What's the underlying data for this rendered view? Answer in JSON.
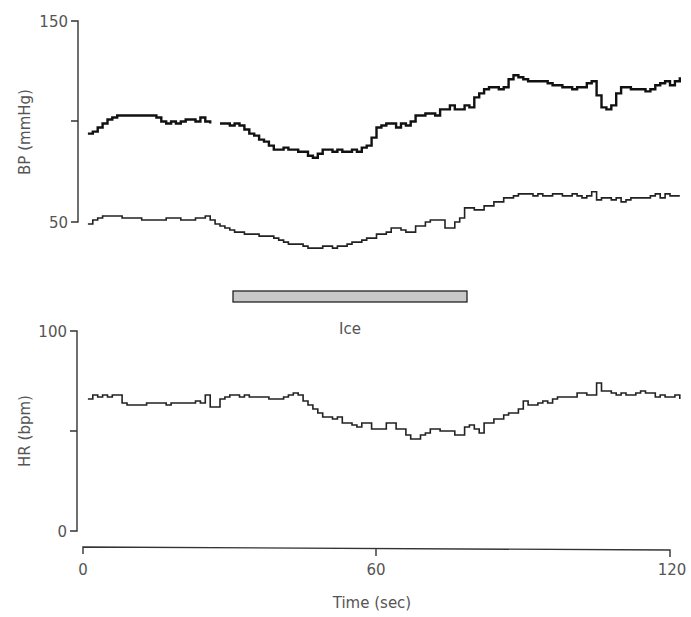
{
  "chart_data": [
    {
      "type": "line",
      "panel": "top",
      "title": "",
      "xlabel": "",
      "ylabel": "BP (mmHg)",
      "ylim": [
        50,
        150
      ],
      "yticks": [
        50,
        100,
        150
      ],
      "ytick_labels": [
        "50",
        "",
        "150"
      ],
      "xlim": [
        0,
        120
      ],
      "step": true,
      "series": [
        {
          "name": "Systolic BP",
          "x": [
            1,
            2,
            3,
            4,
            5,
            6,
            7,
            8,
            10,
            12,
            14,
            15,
            16,
            17,
            18,
            19,
            20,
            21,
            22,
            23,
            24,
            25,
            26,
            27,
            28,
            29,
            30,
            31,
            32,
            33,
            34,
            35,
            36,
            37,
            38,
            39,
            40,
            41,
            42,
            43,
            44,
            45,
            46,
            47,
            48,
            49,
            50,
            51,
            52,
            53,
            54,
            55,
            56,
            57,
            58,
            59,
            60,
            61,
            62,
            63,
            64,
            65,
            66,
            67,
            68,
            69,
            70,
            71,
            72,
            73,
            74,
            75,
            76,
            77,
            78,
            79,
            80,
            81,
            82,
            83,
            84,
            85,
            86,
            87,
            88,
            89,
            90,
            91,
            92,
            93,
            94,
            95,
            96,
            97,
            98,
            99,
            100,
            101,
            102,
            103,
            104,
            105,
            106,
            107,
            108,
            109,
            110,
            111,
            112,
            113,
            114,
            115,
            116,
            117,
            118,
            119,
            120,
            121,
            122
          ],
          "values": [
            94,
            95,
            97,
            99,
            101,
            102,
            103,
            103,
            103,
            103,
            103,
            102,
            100,
            99,
            100,
            99,
            100,
            101,
            101,
            100,
            102,
            100,
            99,
            null,
            99,
            99,
            98,
            99,
            98,
            96,
            94,
            93,
            91,
            90,
            88,
            86,
            86,
            87,
            86,
            86,
            85,
            85,
            83,
            82,
            84,
            86,
            86,
            85,
            86,
            85,
            85,
            86,
            85,
            87,
            88,
            92,
            97,
            98,
            99,
            99,
            97,
            99,
            98,
            100,
            103,
            103,
            104,
            104,
            103,
            106,
            106,
            108,
            106,
            106,
            108,
            107,
            112,
            114,
            116,
            117,
            117,
            116,
            117,
            121,
            123,
            122,
            121,
            120,
            120,
            120,
            120,
            119,
            118,
            118,
            117,
            117,
            116,
            117,
            117,
            119,
            120,
            113,
            107,
            106,
            108,
            114,
            117,
            117,
            116,
            116,
            116,
            115,
            116,
            118,
            119,
            120,
            118,
            120,
            122,
            122,
            120,
            121,
            122,
            120,
            122,
            121,
            122,
            122,
            121,
            121
          ]
        },
        {
          "name": "Diastolic BP",
          "x": [
            1,
            2,
            3,
            4,
            5,
            6,
            7,
            8,
            9,
            10,
            11,
            12,
            13,
            14,
            15,
            16,
            17,
            18,
            19,
            20,
            21,
            22,
            23,
            24,
            25,
            26,
            27,
            28,
            29,
            30,
            31,
            32,
            33,
            34,
            35,
            36,
            37,
            38,
            39,
            40,
            41,
            42,
            43,
            44,
            45,
            46,
            47,
            48,
            49,
            50,
            51,
            52,
            53,
            54,
            55,
            56,
            57,
            58,
            59,
            60,
            61,
            62,
            63,
            64,
            65,
            66,
            67,
            68,
            69,
            70,
            71,
            72,
            73,
            74,
            75,
            76,
            77,
            78,
            79,
            80,
            81,
            82,
            83,
            84,
            85,
            86,
            87,
            88,
            89,
            90,
            91,
            92,
            93,
            94,
            95,
            96,
            97,
            98,
            99,
            100,
            101,
            102,
            103,
            104,
            105,
            106,
            107,
            108,
            109,
            110,
            111,
            112,
            113,
            114,
            115,
            116,
            117,
            118,
            119,
            120,
            121,
            122
          ],
          "values": [
            49,
            51,
            52,
            53,
            53,
            53,
            53,
            52,
            52,
            52,
            52,
            51,
            51,
            51,
            51,
            51,
            52,
            52,
            52,
            51,
            51,
            51,
            52,
            52,
            53,
            51,
            49,
            48,
            47,
            46,
            45,
            45,
            44,
            44,
            44,
            43,
            43,
            43,
            42,
            41,
            40,
            39,
            39,
            39,
            38,
            37,
            37,
            37,
            38,
            38,
            37,
            38,
            38,
            39,
            40,
            40,
            41,
            42,
            42,
            44,
            44,
            45,
            47,
            47,
            46,
            45,
            45,
            48,
            48,
            50,
            51,
            51,
            51,
            47,
            47,
            50,
            52,
            57,
            57,
            56,
            56,
            58,
            58,
            60,
            60,
            62,
            62,
            63,
            64,
            64,
            64,
            63,
            64,
            63,
            63,
            64,
            64,
            63,
            63,
            64,
            63,
            62,
            63,
            65,
            61,
            62,
            62,
            61,
            62,
            60,
            61,
            62,
            62,
            62,
            62,
            63,
            64,
            62,
            64,
            63,
            63,
            63
          ],
          "note": "steps approximate"
        }
      ],
      "annotations": [
        {
          "type": "bar",
          "label": "Ice",
          "x_start": 31,
          "x_end": 78
        }
      ]
    },
    {
      "type": "line",
      "panel": "bottom",
      "title": "",
      "xlabel": "Time (sec)",
      "ylabel": "HR (bpm)",
      "ylim": [
        0,
        100
      ],
      "yticks": [
        0,
        50,
        100
      ],
      "ytick_labels": [
        "0",
        "",
        "100"
      ],
      "xlim": [
        0,
        120
      ],
      "xticks": [
        0,
        60,
        120
      ],
      "xtick_labels": [
        "0",
        "60",
        "120"
      ],
      "step": true,
      "series": [
        {
          "name": "HR",
          "x": [
            1,
            2,
            3,
            4,
            5,
            6,
            7,
            8,
            9,
            10,
            11,
            12,
            13,
            14,
            15,
            16,
            17,
            18,
            19,
            20,
            21,
            22,
            23,
            24,
            25,
            26,
            27,
            28,
            29,
            30,
            31,
            32,
            33,
            34,
            35,
            36,
            37,
            38,
            39,
            40,
            41,
            42,
            43,
            44,
            45,
            46,
            47,
            48,
            49,
            50,
            51,
            52,
            53,
            54,
            55,
            56,
            57,
            58,
            59,
            60,
            61,
            62,
            63,
            64,
            65,
            66,
            67,
            68,
            69,
            70,
            71,
            72,
            73,
            74,
            75,
            76,
            77,
            78,
            79,
            80,
            81,
            82,
            83,
            84,
            85,
            86,
            87,
            88,
            89,
            90,
            91,
            92,
            93,
            94,
            95,
            96,
            97,
            98,
            99,
            100,
            101,
            102,
            103,
            104,
            105,
            106,
            107,
            108,
            109,
            110,
            111,
            112,
            113,
            114,
            115,
            116,
            117,
            118,
            119,
            120,
            121,
            122
          ],
          "values": [
            66,
            68,
            67,
            68,
            67,
            68,
            68,
            64,
            63,
            63,
            63,
            63,
            64,
            64,
            64,
            64,
            63,
            64,
            64,
            64,
            64,
            64,
            65,
            64,
            68,
            62,
            62,
            66,
            67,
            68,
            68,
            67,
            68,
            67,
            67,
            67,
            67,
            66,
            66,
            66,
            67,
            68,
            69,
            68,
            65,
            63,
            61,
            59,
            57,
            57,
            56,
            57,
            54,
            54,
            53,
            52,
            54,
            54,
            51,
            51,
            51,
            54,
            54,
            51,
            51,
            48,
            46,
            46,
            48,
            49,
            51,
            51,
            50,
            50,
            50,
            48,
            48,
            52,
            53,
            51,
            49,
            54,
            54,
            56,
            56,
            58,
            59,
            59,
            61,
            65,
            63,
            63,
            64,
            65,
            64,
            66,
            67,
            67,
            67,
            67,
            69,
            69,
            68,
            68,
            74,
            70,
            70,
            69,
            68,
            69,
            68,
            68,
            69,
            70,
            69,
            69,
            67,
            68,
            67,
            67,
            68,
            66
          ],
          "note": "steps approximate"
        }
      ]
    }
  ],
  "labels": {
    "bp_ylabel": "BP (mmHg)",
    "bp_tick_150": "150",
    "bp_tick_50": "50",
    "hr_ylabel": "HR (bpm)",
    "hr_tick_100": "100",
    "hr_tick_0": "0",
    "x_tick_0": "0",
    "x_tick_60": "60",
    "x_tick_120": "120",
    "xlabel": "Time (sec)",
    "ice_label": "Ice"
  },
  "colors": {
    "trace": "#111111",
    "axis": "#333333",
    "text": "#555555",
    "ice_bar_fill": "#c8c8c8",
    "ice_bar_stroke": "#222222"
  }
}
